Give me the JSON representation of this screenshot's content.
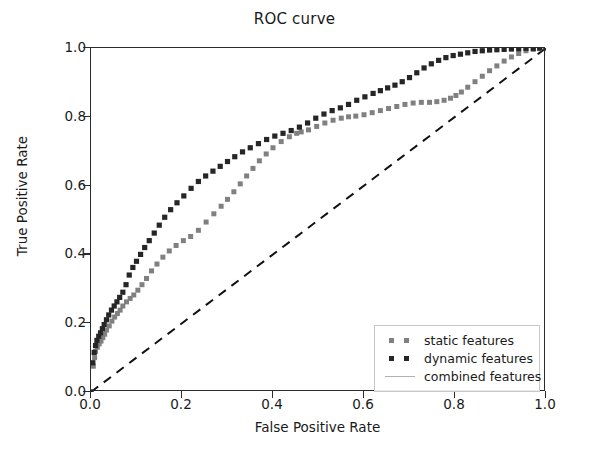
{
  "chart_data": {
    "type": "line",
    "title": "ROC curve",
    "xlabel": "False Positive Rate",
    "ylabel": "True Positive Rate",
    "xlim": [
      0.0,
      1.0
    ],
    "ylim": [
      0.0,
      1.0
    ],
    "xticks": [
      "0.0",
      "0.2",
      "0.4",
      "0.6",
      "0.8",
      "1.0"
    ],
    "yticks": [
      "0.0",
      "0.2",
      "0.4",
      "0.6",
      "0.8",
      "1.0"
    ],
    "xtick_values": [
      0.0,
      0.2,
      0.4,
      0.6,
      0.8,
      1.0
    ],
    "ytick_values": [
      0.0,
      0.2,
      0.4,
      0.6,
      0.8,
      1.0
    ],
    "grid": false,
    "legend_position": "lower right",
    "series": [
      {
        "name": "static features",
        "style": "dotted-square-markers",
        "color": "#808080",
        "x": [
          0.0,
          0.005,
          0.008,
          0.01,
          0.014,
          0.018,
          0.022,
          0.026,
          0.03,
          0.034,
          0.04,
          0.046,
          0.052,
          0.058,
          0.064,
          0.07,
          0.078,
          0.086,
          0.094,
          0.103,
          0.112,
          0.122,
          0.133,
          0.145,
          0.158,
          0.172,
          0.187,
          0.203,
          0.219,
          0.236,
          0.253,
          0.27,
          0.286,
          0.3,
          0.314,
          0.328,
          0.342,
          0.356,
          0.37,
          0.385,
          0.4,
          0.418,
          0.436,
          0.452,
          0.462,
          0.478,
          0.496,
          0.514,
          0.532,
          0.55,
          0.566,
          0.582,
          0.6,
          0.618,
          0.636,
          0.654,
          0.672,
          0.69,
          0.708,
          0.726,
          0.744,
          0.76,
          0.776,
          0.79,
          0.802,
          0.814,
          0.828,
          0.844,
          0.86,
          0.876,
          0.892,
          0.908,
          0.924,
          0.94,
          0.956,
          0.972,
          0.986,
          1.0
        ],
        "y": [
          0.0,
          0.075,
          0.1,
          0.118,
          0.13,
          0.14,
          0.148,
          0.158,
          0.168,
          0.18,
          0.192,
          0.206,
          0.218,
          0.228,
          0.238,
          0.25,
          0.262,
          0.272,
          0.282,
          0.296,
          0.312,
          0.33,
          0.352,
          0.372,
          0.392,
          0.41,
          0.426,
          0.44,
          0.452,
          0.47,
          0.494,
          0.518,
          0.54,
          0.56,
          0.582,
          0.605,
          0.628,
          0.65,
          0.672,
          0.692,
          0.71,
          0.728,
          0.742,
          0.752,
          0.756,
          0.762,
          0.772,
          0.782,
          0.79,
          0.796,
          0.8,
          0.802,
          0.806,
          0.812,
          0.818,
          0.824,
          0.83,
          0.836,
          0.84,
          0.842,
          0.842,
          0.844,
          0.848,
          0.854,
          0.862,
          0.872,
          0.886,
          0.902,
          0.918,
          0.934,
          0.948,
          0.962,
          0.974,
          0.984,
          0.992,
          0.996,
          0.998,
          1.0
        ]
      },
      {
        "name": "dynamic features",
        "style": "dotted-square-markers",
        "color": "#262626",
        "x": [
          0.0,
          0.004,
          0.007,
          0.01,
          0.013,
          0.017,
          0.021,
          0.025,
          0.029,
          0.034,
          0.039,
          0.045,
          0.051,
          0.057,
          0.063,
          0.07,
          0.077,
          0.084,
          0.092,
          0.1,
          0.109,
          0.118,
          0.128,
          0.139,
          0.15,
          0.162,
          0.175,
          0.189,
          0.204,
          0.22,
          0.236,
          0.252,
          0.268,
          0.284,
          0.3,
          0.316,
          0.333,
          0.35,
          0.368,
          0.386,
          0.404,
          0.422,
          0.44,
          0.458,
          0.476,
          0.494,
          0.512,
          0.53,
          0.548,
          0.566,
          0.584,
          0.602,
          0.62,
          0.636,
          0.652,
          0.668,
          0.684,
          0.7,
          0.716,
          0.732,
          0.748,
          0.764,
          0.78,
          0.796,
          0.812,
          0.828,
          0.844,
          0.86,
          0.876,
          0.892,
          0.908,
          0.924,
          0.94,
          0.956,
          0.972,
          0.986,
          1.0
        ],
        "y": [
          0.0,
          0.085,
          0.115,
          0.135,
          0.15,
          0.162,
          0.172,
          0.184,
          0.196,
          0.21,
          0.224,
          0.238,
          0.25,
          0.262,
          0.275,
          0.29,
          0.312,
          0.34,
          0.362,
          0.38,
          0.4,
          0.42,
          0.44,
          0.462,
          0.485,
          0.508,
          0.53,
          0.55,
          0.57,
          0.592,
          0.612,
          0.628,
          0.642,
          0.656,
          0.67,
          0.684,
          0.698,
          0.71,
          0.722,
          0.734,
          0.744,
          0.752,
          0.76,
          0.77,
          0.782,
          0.796,
          0.808,
          0.818,
          0.826,
          0.836,
          0.848,
          0.858,
          0.868,
          0.876,
          0.884,
          0.892,
          0.902,
          0.914,
          0.928,
          0.942,
          0.954,
          0.964,
          0.972,
          0.978,
          0.982,
          0.986,
          0.99,
          0.992,
          0.994,
          0.995,
          0.996,
          0.997,
          0.998,
          0.999,
          0.999,
          1.0,
          1.0
        ]
      },
      {
        "name": "combined features",
        "style": "step-line",
        "color": "#b0b0b0",
        "x": [
          0.0,
          0.0,
          0.012,
          0.012,
          0.018,
          0.018,
          0.03,
          0.03,
          0.042,
          0.042,
          0.05,
          0.05,
          0.06,
          0.06,
          0.066,
          0.066,
          0.072,
          0.072,
          0.078,
          0.078,
          0.09,
          0.09,
          0.1,
          0.1,
          0.112,
          0.112,
          0.125,
          0.125,
          0.15,
          0.15,
          0.2,
          0.2,
          0.278,
          0.278,
          1.0
        ],
        "y": [
          0.0,
          0.11,
          0.11,
          0.145,
          0.145,
          0.18,
          0.18,
          0.215,
          0.215,
          0.25,
          0.25,
          0.285,
          0.285,
          0.382,
          0.382,
          0.45,
          0.45,
          0.52,
          0.52,
          0.59,
          0.59,
          0.64,
          0.64,
          0.68,
          0.68,
          0.755,
          0.755,
          0.88,
          0.88,
          0.93,
          0.93,
          0.958,
          0.958,
          1.0,
          1.0
        ]
      },
      {
        "name": "chance-diagonal",
        "style": "dashed-line",
        "color": "#111111",
        "x": [
          0.0,
          1.0
        ],
        "y": [
          0.0,
          1.0
        ]
      }
    ]
  },
  "legend": {
    "entries": [
      {
        "label": "static features",
        "color": "#808080",
        "marker": "square"
      },
      {
        "label": "dynamic features",
        "color": "#262626",
        "marker": "square"
      },
      {
        "label": "combined features",
        "color": "#b0b0b0",
        "marker": "line"
      }
    ]
  },
  "colors": {
    "static": "#808080",
    "dynamic": "#262626",
    "combined": "#b0b0b0",
    "diagonal": "#111111",
    "axis": "#2b2b2b",
    "text": "#1a1a1a",
    "background": "#ffffff"
  }
}
